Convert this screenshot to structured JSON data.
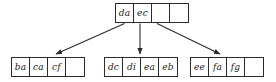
{
  "diagram": {
    "type": "b-tree",
    "title": "",
    "nodes": [
      {
        "id": "root",
        "role": "root-node",
        "capacity": 4,
        "cells": [
          "da",
          "ec",
          "",
          ""
        ]
      },
      {
        "id": "leaf-left",
        "role": "leaf-node",
        "capacity": 4,
        "cells": [
          "ba",
          "ca",
          "cf",
          ""
        ]
      },
      {
        "id": "leaf-middle",
        "role": "leaf-node",
        "capacity": 4,
        "cells": [
          "dc",
          "di",
          "ea",
          "eb"
        ]
      },
      {
        "id": "leaf-right",
        "role": "leaf-node",
        "capacity": 4,
        "cells": [
          "ee",
          "fa",
          "fg",
          ""
        ]
      }
    ],
    "edges": [
      {
        "id": "edge-root-to-left",
        "from": "root",
        "to": "leaf-left",
        "style": "arrow"
      },
      {
        "id": "edge-root-to-middle",
        "from": "root",
        "to": "leaf-middle",
        "style": "arrow"
      },
      {
        "id": "edge-root-to-right",
        "from": "root",
        "to": "leaf-right",
        "style": "arrow"
      }
    ],
    "colors": {
      "stroke": "#2b2b2b",
      "text": "#1a1a1a",
      "background": "#ffffff"
    }
  }
}
